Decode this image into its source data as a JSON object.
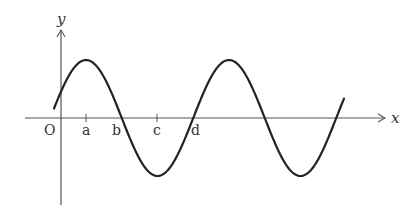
{
  "figure": {
    "type": "sine wave graph",
    "axes": {
      "x_label": "x",
      "y_label": "y",
      "origin_label": "O"
    },
    "points": [
      {
        "label": "a",
        "description": "first crest position (tick)"
      },
      {
        "label": "b",
        "description": "zero crossing after first crest"
      },
      {
        "label": "c",
        "description": "first trough position (tick)"
      },
      {
        "label": "d",
        "description": "zero crossing after first trough"
      }
    ],
    "colors": {
      "curve": "#222222",
      "axis": "#555555",
      "text": "#333333"
    }
  }
}
